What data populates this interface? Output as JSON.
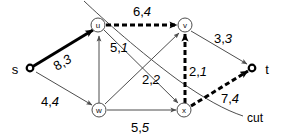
{
  "figure": {
    "type": "flow-network-diagram",
    "background": "#ffffff",
    "stroke_color": "#4d4d4d",
    "highlight_color": "#000000",
    "width": 281,
    "height": 137
  },
  "nodes": {
    "s": {
      "label": "s",
      "cx": 30,
      "cy": 68,
      "kind": "terminal"
    },
    "t": {
      "label": "t",
      "cx": 252,
      "cy": 68,
      "kind": "terminal"
    },
    "u": {
      "label": "u",
      "cx": 98,
      "cy": 25,
      "kind": "circle"
    },
    "v": {
      "label": "v",
      "cx": 185,
      "cy": 25,
      "kind": "circle"
    },
    "w": {
      "label": "w",
      "cx": 99,
      "cy": 110,
      "kind": "circle"
    },
    "x": {
      "label": "x",
      "cx": 184,
      "cy": 110,
      "kind": "circle"
    }
  },
  "terminal_labels": {
    "s": {
      "text": "s",
      "x": 15,
      "y": 69
    },
    "t": {
      "text": "t",
      "x": 267,
      "y": 69
    }
  },
  "edges": [
    {
      "id": "s-u",
      "from": "s",
      "to": "u",
      "capacity": "8",
      "flow": "3",
      "label_x": 62,
      "label_y": 62,
      "style": "bold-solid"
    },
    {
      "id": "u-v",
      "from": "u",
      "to": "v",
      "capacity": "6",
      "flow": "4",
      "label_x": 142,
      "label_y": 11,
      "style": "bold-dashed"
    },
    {
      "id": "v-t",
      "from": "v",
      "to": "t",
      "capacity": "3",
      "flow": "3",
      "label_x": 223,
      "label_y": 38,
      "style": "thin-solid"
    },
    {
      "id": "s-w",
      "from": "s",
      "to": "w",
      "capacity": "4",
      "flow": "4",
      "label_x": 50,
      "label_y": 101,
      "style": "thin-solid"
    },
    {
      "id": "w-u",
      "from": "w",
      "to": "u",
      "capacity": "5",
      "flow": "1",
      "label_x": 119,
      "label_y": 47,
      "style": "thin-solid"
    },
    {
      "id": "w-v",
      "from": "w",
      "to": "v",
      "capacity": "2",
      "flow": "2",
      "label_x": 151,
      "label_y": 79,
      "style": "thin-solid"
    },
    {
      "id": "w-x",
      "from": "w",
      "to": "x",
      "capacity": "5",
      "flow": "5",
      "label_x": 140,
      "label_y": 127,
      "style": "thin-solid"
    },
    {
      "id": "x-v",
      "from": "x",
      "to": "v",
      "capacity": "2",
      "flow": "1",
      "label_x": 198,
      "label_y": 71,
      "style": "bold-dashed"
    },
    {
      "id": "x-t",
      "from": "x",
      "to": "t",
      "capacity": "7",
      "flow": "4",
      "label_x": 230,
      "label_y": 98,
      "style": "bold-dashed"
    },
    {
      "id": "u-x",
      "from": "u",
      "to": "x",
      "capacity": "",
      "flow": "",
      "label_x": 0,
      "label_y": 0,
      "style": "thin-solid"
    }
  ],
  "cut": {
    "label": "cut",
    "label_x": 247,
    "label_y": 118
  }
}
